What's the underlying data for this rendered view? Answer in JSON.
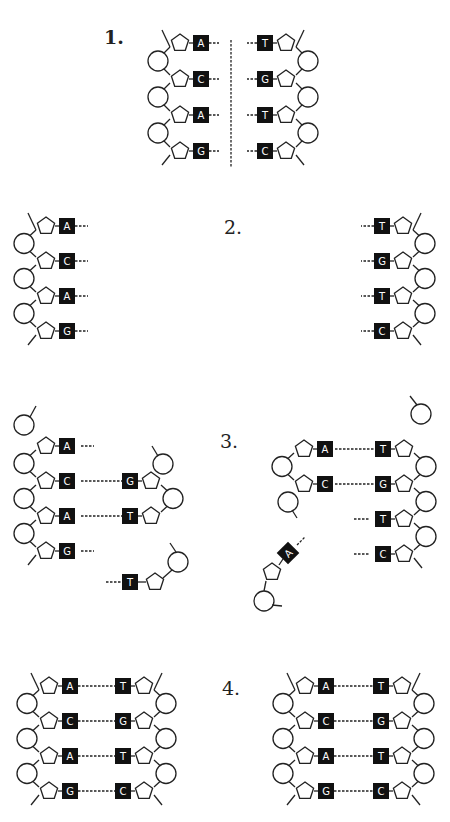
{
  "diagram": {
    "steps": [
      {
        "label": "1.",
        "left_strand": [
          "A",
          "C",
          "A",
          "G"
        ],
        "right_strand": [
          "T",
          "G",
          "T",
          "C"
        ],
        "description": "double helix with dashed unzip line"
      },
      {
        "label": "2.",
        "left_strand": [
          "A",
          "C",
          "A",
          "G"
        ],
        "right_strand": [
          "T",
          "G",
          "T",
          "C"
        ],
        "description": "strands separated"
      },
      {
        "label": "3.",
        "left_pairs": [
          [
            "A",
            ""
          ],
          [
            "C",
            "G"
          ],
          [
            "A",
            "T"
          ],
          [
            "G",
            ""
          ]
        ],
        "free_nucleotides": [
          "T",
          "A"
        ],
        "right_pairs": [
          [
            "A",
            "T"
          ],
          [
            "C",
            "G"
          ],
          [
            "",
            "T"
          ],
          [
            "",
            "C"
          ]
        ],
        "description": "complementary nucleotides attach"
      },
      {
        "label": "4.",
        "left_helix": [
          [
            "A",
            "T"
          ],
          [
            "C",
            "G"
          ],
          [
            "A",
            "T"
          ],
          [
            "G",
            "C"
          ]
        ],
        "right_helix": [
          [
            "A",
            "T"
          ],
          [
            "C",
            "G"
          ],
          [
            "A",
            "T"
          ],
          [
            "G",
            "C"
          ]
        ],
        "description": "two identical double helices"
      }
    ]
  }
}
